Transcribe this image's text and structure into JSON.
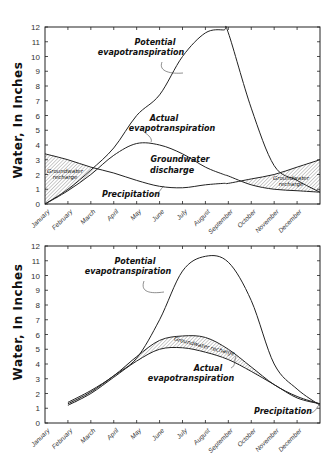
{
  "chart_data": [
    {
      "type": "line",
      "panel": "top",
      "title": "",
      "xlabel": "",
      "ylabel": "Water, In Inches",
      "ylim": [
        0,
        12
      ],
      "yticks": [
        "0",
        "1",
        "2",
        "3",
        "4",
        "5",
        "6",
        "7",
        "8",
        "9",
        "10",
        "11",
        "12"
      ],
      "categories": [
        "January",
        "February",
        "March",
        "April",
        "May",
        "June",
        "July",
        "August",
        "September",
        "October",
        "November",
        "December"
      ],
      "x": [
        0,
        1,
        2,
        3,
        4,
        5,
        6,
        7,
        7.8,
        8,
        9,
        10,
        11,
        12
      ],
      "series": [
        {
          "name": "Potential evapotranspiration",
          "values": [
            0,
            1.0,
            2.3,
            3.8,
            6.0,
            7.4,
            10.0,
            11.6,
            11.8,
            11.6,
            6.5,
            2.6,
            1.6,
            0.8
          ]
        },
        {
          "name": "Actual evapotranspiration",
          "values": [
            0,
            0.9,
            2.0,
            3.3,
            4.1,
            4.0,
            3.4,
            2.5,
            2.0,
            1.9,
            1.3,
            1.0,
            0.9,
            0.8
          ]
        },
        {
          "name": "Precipitation",
          "values": [
            3.4,
            3.0,
            2.5,
            2.1,
            1.6,
            1.2,
            1.1,
            1.3,
            1.4,
            1.4,
            1.7,
            2.0,
            2.5,
            3.0
          ]
        }
      ],
      "annotations": [
        {
          "text": "Potential evapotranspiration"
        },
        {
          "text": "Actual evapotranspiration"
        },
        {
          "text": "Groundwater discharge"
        },
        {
          "text": "Precipitation"
        },
        {
          "text": "Groundwater recharge",
          "region": "early"
        },
        {
          "text": "Groundwater recharge",
          "region": "late"
        }
      ],
      "grid": false
    },
    {
      "type": "line",
      "panel": "bottom",
      "title": "",
      "xlabel": "",
      "ylabel": "Water, In Inches",
      "ylim": [
        0,
        12
      ],
      "yticks": [
        "0",
        "1",
        "2",
        "3",
        "4",
        "5",
        "6",
        "7",
        "8",
        "9",
        "10",
        "11",
        "12"
      ],
      "categories": [
        "January",
        "February",
        "March",
        "April",
        "May",
        "June",
        "July",
        "August",
        "September",
        "October",
        "November",
        "December"
      ],
      "x": [
        1,
        2,
        3,
        4,
        5,
        6,
        7,
        8,
        9,
        10,
        11,
        12
      ],
      "series": [
        {
          "name": "Potential evapotranspiration",
          "values": [
            1.3,
            2.1,
            3.2,
            4.4,
            7.0,
            10.3,
            11.3,
            10.9,
            8.3,
            4.0,
            2.3,
            1.2
          ]
        },
        {
          "name": "Precipitation",
          "values": [
            1.4,
            2.2,
            3.2,
            4.5,
            5.6,
            5.9,
            5.8,
            5.0,
            3.8,
            2.6,
            1.8,
            1.3
          ]
        },
        {
          "name": "Actual evapotranspiration",
          "values": [
            1.2,
            2.0,
            3.1,
            4.2,
            5.0,
            5.1,
            4.8,
            4.3,
            3.5,
            2.6,
            1.7,
            1.3
          ]
        }
      ],
      "annotations": [
        {
          "text": "Potential evapotranspiration"
        },
        {
          "text": "Groundwater recharge"
        },
        {
          "text": "Actual evapotranspiration"
        },
        {
          "text": "Precipitation"
        }
      ],
      "grid": false
    }
  ],
  "labels": {
    "ylabel": "Water, In Inches",
    "top": {
      "pet_line1": "Potential",
      "pet_line2": "evapotranspiration",
      "aet_line1": "Actual",
      "aet_line2": "evapotranspiration",
      "gwd_line1": "Groundwater",
      "gwd_line2": "discharge",
      "precip": "Precipitation",
      "gwr_line1": "Groundwater",
      "gwr_line2": "recharge"
    },
    "bottom": {
      "pet_line1": "Potential",
      "pet_line2": "evapotranspiration",
      "gwr": "Groundwater recharge",
      "aet_line1": "Actual",
      "aet_line2": "evapotranspiration",
      "precip": "Precipitation"
    }
  }
}
